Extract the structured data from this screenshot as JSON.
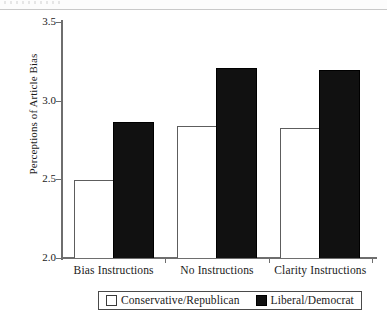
{
  "chart_data": {
    "type": "bar",
    "title": "",
    "xlabel": "",
    "ylabel": "Perceptions of Article Bias",
    "ylim": [
      2.0,
      3.5
    ],
    "ytick_labels": [
      "2.0",
      "2.5",
      "3.0",
      "3.5"
    ],
    "ytick_values": [
      2.0,
      2.5,
      3.0,
      3.5
    ],
    "grid": false,
    "legend_position": "bottom",
    "categories": [
      "Bias Instructions",
      "No Instructions",
      "Clarity Instructions"
    ],
    "series": [
      {
        "name": "Conservative/Republican",
        "style": "light",
        "color": "#ffffff",
        "edge_color": "#5d5d5d",
        "values": [
          2.49,
          2.83,
          2.82
        ]
      },
      {
        "name": "Liberal/Democrat",
        "style": "dark",
        "color": "#111111",
        "edge_color": "#000000",
        "values": [
          2.86,
          3.2,
          3.19
        ]
      }
    ]
  },
  "legend": {
    "items": [
      {
        "label": "Conservative/Republican",
        "style": "light"
      },
      {
        "label": "Liberal/Democrat",
        "style": "dark"
      }
    ]
  }
}
